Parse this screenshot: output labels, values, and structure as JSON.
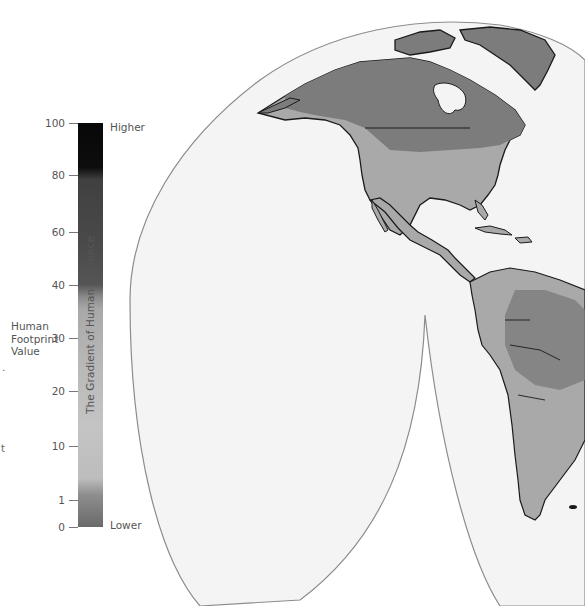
{
  "legend": {
    "title": "The Gradient of Human Influence",
    "axis_label_lines": [
      "Human",
      "Footprint",
      "Value"
    ],
    "high_label": "Higher",
    "low_label": "Lower",
    "ticks": [
      {
        "value": "100",
        "y": 116
      },
      {
        "value": "80",
        "y": 168
      },
      {
        "value": "60",
        "y": 225
      },
      {
        "value": "40",
        "y": 278
      },
      {
        "value": "30",
        "y": 331
      },
      {
        "value": "20",
        "y": 384
      },
      {
        "value": "10",
        "y": 439
      },
      {
        "value": "1",
        "y": 493
      },
      {
        "value": "0",
        "y": 520
      }
    ],
    "colors": {
      "high": "#080808",
      "mid_high": "#4a4a4a",
      "mid": "#b8b8b8",
      "low": "#6a6a6a"
    }
  },
  "map": {
    "projection": "interrupted (Goode homolosine style) western hemisphere lobes",
    "regions": [
      "North America",
      "Greenland",
      "Central America",
      "Caribbean",
      "South America"
    ],
    "land_high_color": "#7a7a7a",
    "land_mid_color": "#a9a9a9",
    "ocean_color": "#f4f4f4",
    "border_color": "#1a1a1a",
    "outline_color": "#8c8c8c"
  },
  "stray_text": {
    "left_mark_1": ".",
    "left_mark_2": "t"
  }
}
